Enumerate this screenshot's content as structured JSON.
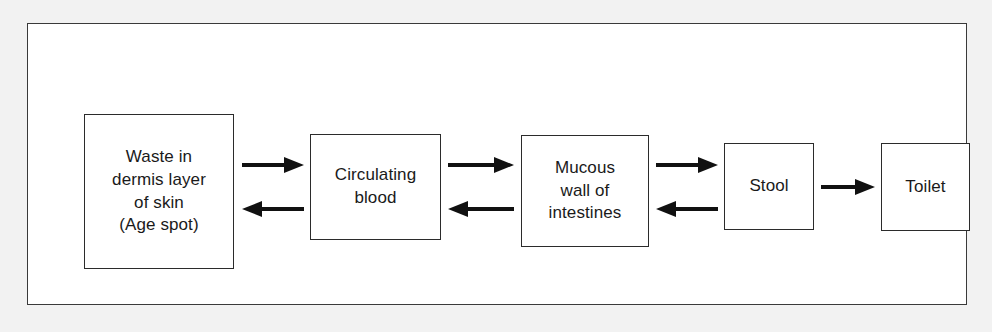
{
  "diagram": {
    "background_color": "#f2f2f2",
    "panel_color": "#ffffff",
    "line_color": "#2b2b2b",
    "type": "flow-diagram",
    "nodes": [
      {
        "id": "waste",
        "label": "Waste in\ndermis layer\nof skin\n(Age spot)"
      },
      {
        "id": "blood",
        "label": "Circulating\nblood"
      },
      {
        "id": "mucous",
        "label": "Mucous\nwall of\nintestines"
      },
      {
        "id": "stool",
        "label": "Stool"
      },
      {
        "id": "toilet",
        "label": "Toilet"
      }
    ],
    "edges": [
      {
        "id": "waste-to-blood",
        "from": "waste",
        "to": "blood",
        "direction": "right"
      },
      {
        "id": "blood-to-waste",
        "from": "blood",
        "to": "waste",
        "direction": "left"
      },
      {
        "id": "blood-to-mucous",
        "from": "blood",
        "to": "mucous",
        "direction": "right"
      },
      {
        "id": "mucous-to-blood",
        "from": "mucous",
        "to": "blood",
        "direction": "left"
      },
      {
        "id": "mucous-to-stool",
        "from": "mucous",
        "to": "stool",
        "direction": "right"
      },
      {
        "id": "stool-to-mucous",
        "from": "stool",
        "to": "mucous",
        "direction": "left"
      },
      {
        "id": "stool-to-toilet",
        "from": "stool",
        "to": "toilet",
        "direction": "right"
      }
    ]
  }
}
